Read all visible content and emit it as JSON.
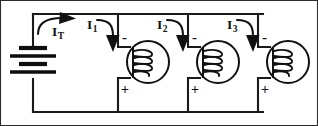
{
  "figure": {
    "name": "parallel-coil-circuit",
    "type": "electrical-schematic",
    "width": 318,
    "height": 126,
    "background_color": "#ffffff",
    "line_color": "#111111"
  },
  "source": {
    "symbol": "battery",
    "name": "dc-battery",
    "plates": 4
  },
  "currents": [
    {
      "id": "IT",
      "letter": "I",
      "subscript": "T",
      "x": 53,
      "y": 23,
      "arrow": "curved-right"
    },
    {
      "id": "I1",
      "letter": "I",
      "subscript": "1",
      "x": 88,
      "y": 17,
      "arrow": "curved-down"
    },
    {
      "id": "I2",
      "letter": "I",
      "subscript": "2",
      "x": 158,
      "y": 17,
      "arrow": "curved-down"
    },
    {
      "id": "I3",
      "letter": "I",
      "subscript": "3",
      "x": 228,
      "y": 17,
      "arrow": "curved-down"
    }
  ],
  "loads": [
    {
      "id": "coil-1",
      "symbol": "coil-in-circle",
      "cx": 148,
      "cy": 62,
      "r": 21,
      "terminal_top": "-",
      "terminal_bottom": "+",
      "minus_x": 124,
      "minus_y": 34,
      "plus_x": 124,
      "plus_y": 82
    },
    {
      "id": "coil-2",
      "symbol": "coil-in-circle",
      "cx": 218,
      "cy": 62,
      "r": 21,
      "terminal_top": "-",
      "terminal_bottom": "+",
      "minus_x": 194,
      "minus_y": 34,
      "plus_x": 194,
      "plus_y": 82
    },
    {
      "id": "coil-3",
      "symbol": "coil-in-circle",
      "cx": 288,
      "cy": 62,
      "r": 21,
      "terminal_top": "-",
      "terminal_bottom": "+",
      "minus_x": 264,
      "minus_y": 34,
      "plus_x": 264,
      "plus_y": 82
    }
  ],
  "signs": {
    "minus": "-",
    "plus": "+"
  }
}
